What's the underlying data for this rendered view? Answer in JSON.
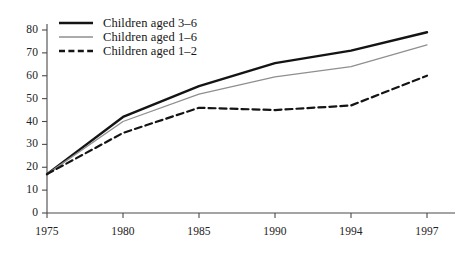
{
  "chart_data": {
    "type": "line",
    "title": "",
    "subtitle": "",
    "xlabel": "",
    "ylabel": "",
    "x": [
      "1975",
      "1980",
      "1985",
      "1990",
      "1994",
      "1997"
    ],
    "categories": [
      "1975",
      "1980",
      "1985",
      "1990",
      "1994",
      "1997"
    ],
    "xtick_labels": [
      "1975",
      "1980",
      "1985",
      "1990",
      "1994",
      "1997"
    ],
    "ytick_labels": [
      "0",
      "10",
      "20",
      "30",
      "40",
      "50",
      "60",
      "70",
      "80"
    ],
    "ytick_values": [
      0,
      10,
      20,
      30,
      40,
      50,
      60,
      70,
      80
    ],
    "ylim": [
      0,
      83
    ],
    "grid": false,
    "legend_position": "top-left",
    "series": [
      {
        "name": "Children aged 3–6",
        "values": [
          17,
          42,
          55.5,
          65.5,
          71,
          79
        ],
        "style": "solid",
        "color": "#141414",
        "width": 2.4
      },
      {
        "name": "Children aged 1–6",
        "values": [
          17,
          40,
          52,
          59.5,
          64,
          73.5
        ],
        "style": "solid",
        "color": "#8f8f8f",
        "width": 1.3
      },
      {
        "name": "Children aged 1–2",
        "values": [
          17,
          35,
          46,
          45,
          47,
          60
        ],
        "style": "dashed",
        "color": "#141414",
        "width": 2.2
      }
    ]
  },
  "legend": {
    "items": [
      {
        "label": "Children aged 3–6",
        "swatch": "solid-thick-black"
      },
      {
        "label": "Children aged 1–6",
        "swatch": "solid-thin-gray"
      },
      {
        "label": "Children aged 1–2",
        "swatch": "dashed-black"
      }
    ]
  },
  "axes": {
    "y_ticks": [
      "80",
      "70",
      "60",
      "50",
      "40",
      "30",
      "20",
      "10",
      "0"
    ],
    "x_ticks": [
      "1975",
      "1980",
      "1985",
      "1990",
      "1994",
      "1997"
    ]
  },
  "colors": {
    "background": "#ffffff",
    "axis": "#4a4a4a",
    "series_dark": "#141414",
    "series_gray": "#8f8f8f",
    "text": "#1a1a1a"
  }
}
